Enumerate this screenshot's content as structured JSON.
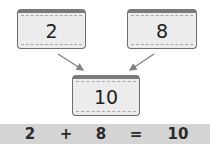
{
  "cards": [
    {
      "value": "2"
    },
    {
      "value": "8"
    },
    {
      "value": "10"
    }
  ],
  "equation": {
    "left": "2",
    "op": "+",
    "right": "8",
    "eq": "=",
    "result": "10"
  },
  "colors": {
    "card_fill": "#ececec",
    "card_border": "#6e6e6e",
    "arrow": "#808080",
    "bar_bg": "#d4d4d4"
  }
}
